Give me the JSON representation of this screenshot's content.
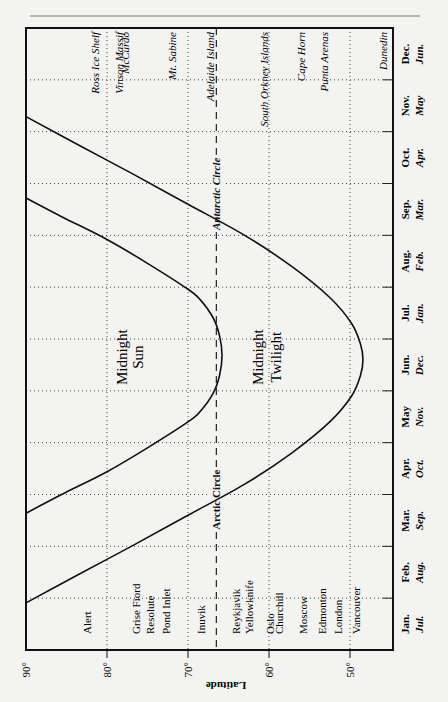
{
  "chart_data": {
    "type": "line",
    "orientation": "rotated-90-ccw",
    "title": "",
    "xlabel": "Latitude",
    "ylabel": "",
    "lat_ticks": [
      {
        "value": 90,
        "label": "90°"
      },
      {
        "value": 80,
        "label": "80°"
      },
      {
        "value": 70,
        "label": "70°"
      },
      {
        "value": 60,
        "label": "60°"
      },
      {
        "value": 50,
        "label": "50°"
      }
    ],
    "lat_range": [
      90,
      45.5
    ],
    "month_range": [
      0,
      12
    ],
    "months_north": [
      "Jan.",
      "Feb.",
      "Mar.",
      "Apr.",
      "May",
      "Jun.",
      "Jul.",
      "Aug.",
      "Sep.",
      "Oct.",
      "Nov.",
      "Dec."
    ],
    "months_south": [
      "Jul.",
      "Aug.",
      "Sep.",
      "Oct.",
      "Nov.",
      "Dec.",
      "Jan.",
      "Feb.",
      "Mar.",
      "Apr.",
      "May",
      "Jun."
    ],
    "grid": true,
    "reference_line": {
      "name": "Arctic/Antarctic Circle",
      "latitude": 66.5,
      "labels": [
        "Arctic Circle",
        "Antarctic Circle"
      ]
    },
    "series": [
      {
        "name": "Midnight Sun boundary",
        "region_label": [
          "Midnight",
          "Sun"
        ],
        "points": [
          {
            "month": 2.64,
            "lat": 90
          },
          {
            "month": 3.0,
            "lat": 85.6
          },
          {
            "month": 3.44,
            "lat": 80
          },
          {
            "month": 3.9,
            "lat": 75
          },
          {
            "month": 4.4,
            "lat": 70
          },
          {
            "month": 4.6,
            "lat": 68.5
          },
          {
            "month": 4.95,
            "lat": 66.9
          },
          {
            "month": 5.3,
            "lat": 66.1
          },
          {
            "month": 5.68,
            "lat": 65.8
          },
          {
            "month": 6.06,
            "lat": 66.1
          },
          {
            "month": 6.41,
            "lat": 66.9
          },
          {
            "month": 6.76,
            "lat": 68.5
          },
          {
            "month": 6.96,
            "lat": 70
          },
          {
            "month": 7.46,
            "lat": 75
          },
          {
            "month": 7.92,
            "lat": 80
          },
          {
            "month": 8.36,
            "lat": 85.6
          },
          {
            "month": 8.72,
            "lat": 90
          }
        ]
      },
      {
        "name": "Midnight Twilight boundary",
        "region_label": [
          "Midnight",
          "Twilight"
        ],
        "points": [
          {
            "month": 0.91,
            "lat": 90
          },
          {
            "month": 1.5,
            "lat": 83
          },
          {
            "month": 2.0,
            "lat": 77
          },
          {
            "month": 2.6,
            "lat": 70
          },
          {
            "month": 3.2,
            "lat": 63
          },
          {
            "month": 3.8,
            "lat": 57.2
          },
          {
            "month": 4.4,
            "lat": 52.5
          },
          {
            "month": 4.9,
            "lat": 49.8
          },
          {
            "month": 5.3,
            "lat": 48.7
          },
          {
            "month": 5.6,
            "lat": 48.4
          },
          {
            "month": 5.9,
            "lat": 48.7
          },
          {
            "month": 6.3,
            "lat": 49.8
          },
          {
            "month": 6.8,
            "lat": 52.5
          },
          {
            "month": 7.4,
            "lat": 57.2
          },
          {
            "month": 8.0,
            "lat": 63
          },
          {
            "month": 8.6,
            "lat": 70
          },
          {
            "month": 9.2,
            "lat": 77
          },
          {
            "month": 9.7,
            "lat": 83
          },
          {
            "month": 10.29,
            "lat": 90
          }
        ]
      }
    ],
    "places_north": [
      {
        "name": "Alert",
        "lat": 82.5
      },
      {
        "name": "Grise Fiord",
        "lat": 76.4
      },
      {
        "name": "Resolute",
        "lat": 74.7
      },
      {
        "name": "Pond Inlet",
        "lat": 72.7
      },
      {
        "name": "Inuvik",
        "lat": 68.4
      },
      {
        "name": "Reykjavik",
        "lat": 64.1
      },
      {
        "name": "Yellowknife",
        "lat": 62.5
      },
      {
        "name": "Oslo",
        "lat": 59.9
      },
      {
        "name": "Churchill",
        "lat": 58.8
      },
      {
        "name": "Moscow",
        "lat": 55.8
      },
      {
        "name": "Edmonton",
        "lat": 53.5
      },
      {
        "name": "London",
        "lat": 51.5
      },
      {
        "name": "Vancouver",
        "lat": 49.3
      }
    ],
    "places_south": [
      {
        "name": "Ross Ice Shelf",
        "lat": 81.5
      },
      {
        "name": "Vinson Massif",
        "lat": 78.5
      },
      {
        "name": "McCurdo",
        "lat": 77.8
      },
      {
        "name": "Mt. Sabine",
        "lat": 72.0
      },
      {
        "name": "Adelaide Island",
        "lat": 67.3
      },
      {
        "name": "South Orkney Islands",
        "lat": 60.6
      },
      {
        "name": "Cape Horn",
        "lat": 56.0
      },
      {
        "name": "Punta Arenas",
        "lat": 53.2
      },
      {
        "name": "Dunedin",
        "lat": 45.9
      }
    ]
  }
}
